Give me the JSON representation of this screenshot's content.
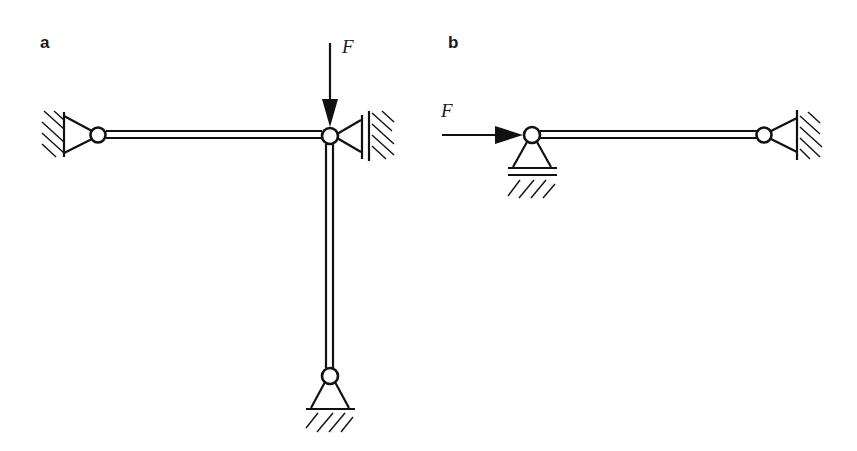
{
  "figure": {
    "panels": [
      {
        "id": "a",
        "label": "a",
        "force_label": "F",
        "force_direction": "down",
        "members": [
          "horizontal beam",
          "vertical column"
        ],
        "supports": [
          "left wall pin support",
          "right wall roller support",
          "bottom ground pin support"
        ]
      },
      {
        "id": "b",
        "label": "b",
        "force_label": "F",
        "force_direction": "right",
        "members": [
          "horizontal beam"
        ],
        "supports": [
          "left ground roller support",
          "right wall pin support"
        ]
      }
    ],
    "colors": {
      "line": "#111111",
      "background": "#ffffff"
    }
  }
}
